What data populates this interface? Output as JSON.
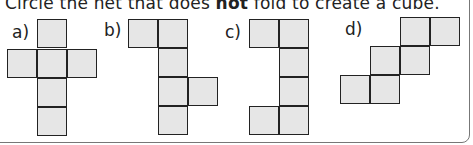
{
  "question": {
    "prefix": "Circle the net that does ",
    "emphasis": "not",
    "suffix": " fold to create a cube."
  },
  "nets": [
    {
      "label": "a)",
      "cells": [
        [
          37,
          19
        ],
        [
          7,
          49
        ],
        [
          37,
          49
        ],
        [
          67,
          49
        ],
        [
          37,
          78
        ],
        [
          37,
          107
        ]
      ]
    },
    {
      "label": "b)",
      "cells": [
        [
          128,
          19
        ],
        [
          158,
          19
        ],
        [
          158,
          48
        ],
        [
          158,
          77
        ],
        [
          188,
          77
        ],
        [
          158,
          106
        ]
      ]
    },
    {
      "label": "c)",
      "cells": [
        [
          249,
          19
        ],
        [
          279,
          19
        ],
        [
          279,
          48
        ],
        [
          279,
          77
        ],
        [
          249,
          106
        ],
        [
          279,
          106
        ]
      ]
    },
    {
      "label": "d)",
      "cells": [
        [
          400,
          17
        ],
        [
          430,
          17
        ],
        [
          370,
          46
        ],
        [
          400,
          46
        ],
        [
          340,
          75
        ],
        [
          370,
          75
        ]
      ]
    }
  ],
  "colors": {
    "cell_fill": "#e6e6e6",
    "cell_border": "#222222"
  }
}
